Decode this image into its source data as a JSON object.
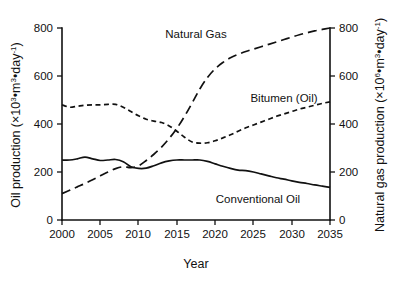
{
  "chart_data": {
    "type": "line",
    "title": "",
    "xlabel": "Year",
    "ylabel": "Oil production (×10³•m³•day⁻¹)",
    "y2label": "Natural gas production (×10⁶•m³•day⁻¹)",
    "xlim": [
      2000,
      2035
    ],
    "ylim": [
      0,
      800
    ],
    "y2lim": [
      0,
      800
    ],
    "xticks": [
      2000,
      2005,
      2010,
      2015,
      2020,
      2025,
      2030,
      2035
    ],
    "yticks": [
      0,
      200,
      400,
      600,
      800
    ],
    "y2ticks": [
      0,
      200,
      400,
      600,
      800
    ],
    "grid": false,
    "legend_position": "inline-annotations",
    "x": [
      2000,
      2001,
      2002,
      2003,
      2004,
      2005,
      2006,
      2007,
      2008,
      2009,
      2010,
      2011,
      2012,
      2013,
      2014,
      2015,
      2016,
      2017,
      2018,
      2019,
      2020,
      2021,
      2022,
      2023,
      2024,
      2025,
      2026,
      2027,
      2028,
      2029,
      2030,
      2031,
      2032,
      2033,
      2034,
      2035
    ],
    "series": [
      {
        "name": "Conventional Oil",
        "axis": "left",
        "style": "solid",
        "label_text": "Conventional Oil",
        "values": [
          250,
          250,
          255,
          262,
          255,
          248,
          250,
          252,
          243,
          222,
          215,
          216,
          226,
          238,
          246,
          250,
          250,
          250,
          250,
          244,
          234,
          224,
          215,
          208,
          206,
          200,
          192,
          184,
          176,
          170,
          163,
          157,
          152,
          146,
          141,
          136
        ]
      },
      {
        "name": "Bitumen (Oil)",
        "axis": "left",
        "style": "short-dash",
        "label_text": "Bitumen (Oil)",
        "values": [
          480,
          470,
          474,
          478,
          480,
          480,
          482,
          482,
          470,
          452,
          434,
          420,
          412,
          406,
          392,
          370,
          345,
          325,
          320,
          322,
          330,
          342,
          355,
          370,
          384,
          396,
          408,
          420,
          432,
          442,
          452,
          462,
          470,
          478,
          486,
          492
        ]
      },
      {
        "name": "Natural Gas",
        "axis": "right",
        "style": "long-dash",
        "label_text": "Natural Gas",
        "values": [
          110,
          124,
          138,
          152,
          168,
          184,
          200,
          214,
          222,
          218,
          226,
          248,
          274,
          304,
          340,
          382,
          432,
          488,
          546,
          594,
          630,
          656,
          676,
          690,
          702,
          712,
          722,
          732,
          742,
          752,
          762,
          772,
          780,
          788,
          794,
          800
        ]
      }
    ],
    "annotations": [
      {
        "text": "Natural Gas",
        "x": 2017,
        "y": 755
      },
      {
        "text": "Bitumen (Oil)",
        "x": 2026,
        "y": 505
      },
      {
        "text": "Conventional Oil",
        "x": 2026,
        "y": 108
      }
    ]
  }
}
